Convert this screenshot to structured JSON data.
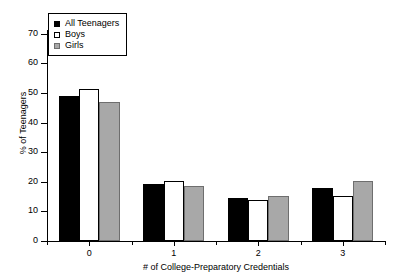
{
  "chart_data": {
    "type": "bar",
    "title": "",
    "xlabel": "# of College-Preparatory Credentials",
    "ylabel": "% of Teenagers",
    "categories": [
      "0",
      "1",
      "2",
      "3"
    ],
    "series": [
      {
        "name": "All Teenagers",
        "color": "#000000",
        "values": [
          49,
          19.3,
          14.5,
          18
        ]
      },
      {
        "name": "Boys",
        "color": "#ffffff",
        "values": [
          51.5,
          20.2,
          14,
          15.2
        ]
      },
      {
        "name": "Girls",
        "color": "#a8a8a8",
        "values": [
          47,
          18.7,
          15.2,
          20.4
        ]
      }
    ],
    "ylim": [
      0,
      70
    ],
    "yticks": [
      0,
      10,
      20,
      30,
      40,
      50,
      60,
      70
    ],
    "ytick_labels": [
      "0",
      "10",
      "20",
      "30",
      "40",
      "50",
      "60",
      "70"
    ],
    "grid": false,
    "legend_position": "upper left",
    "legend_entries": [
      "All Teenagers",
      "Boys",
      "Girls"
    ]
  }
}
